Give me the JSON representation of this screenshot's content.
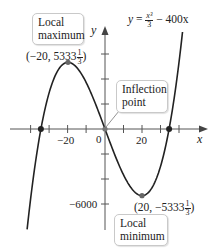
{
  "figure": {
    "equation": {
      "lhs": "y",
      "eq": "=",
      "num": "x³",
      "den": "3",
      "rest": "− 400x"
    },
    "axes": {
      "x_label": "x",
      "y_label": "y",
      "origin_label": "0",
      "x_tick_labels": [
        {
          "value": -20,
          "text": "−20"
        },
        {
          "value": 20,
          "text": "20"
        }
      ],
      "y_tick_labels": [
        {
          "value": -6000,
          "text": "−6000"
        }
      ],
      "x_tick_spacing": 10,
      "y_tick_spacing": 2000
    },
    "callouts": {
      "local_max": {
        "line1": "Local",
        "line2": "maximum"
      },
      "inflection": {
        "line1": "Inflection",
        "line2": "point"
      },
      "local_min": {
        "line1": "Local",
        "line2": "minimum"
      }
    },
    "points": {
      "max": {
        "prefix": "(−20, 5333",
        "num": "1",
        "den": "3",
        "suffix": ")"
      },
      "min": {
        "prefix": "(20, −5333",
        "num": "1",
        "den": "3",
        "suffix": ")"
      }
    },
    "colors": {
      "curve": "#222222",
      "axis": "#555555",
      "callout_border": "#c9c9c9",
      "point": "#222222",
      "extremum_point": "#666666"
    }
  },
  "chart_data": {
    "type": "line",
    "xlabel": "x",
    "ylabel": "y",
    "function": "x^3/3 - 400*x",
    "xlim": [
      -45,
      50
    ],
    "ylim": [
      -7800,
      8000
    ],
    "x_ticks": [
      -40,
      -30,
      -20,
      -10,
      0,
      10,
      20,
      30,
      40
    ],
    "y_ticks": [
      -6000,
      -4000,
      -2000,
      0,
      2000,
      4000,
      6000
    ],
    "grid": false,
    "key_points": [
      {
        "label": "Local maximum",
        "x": -20,
        "y": 5333.33
      },
      {
        "label": "Inflection point",
        "x": 0,
        "y": 0
      },
      {
        "label": "Local minimum",
        "x": 20,
        "y": -5333.33
      },
      {
        "label": "x-intercept",
        "x": -34.64,
        "y": 0
      },
      {
        "label": "x-intercept",
        "x": 34.64,
        "y": 0
      }
    ]
  }
}
